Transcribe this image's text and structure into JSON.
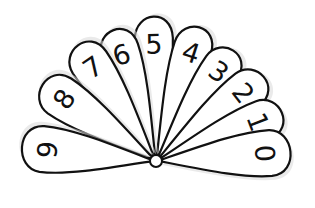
{
  "colors": {
    "outline": "#111111",
    "fill": "#ffffff",
    "background": "#ffffff"
  },
  "pivot": {
    "x": 156,
    "y": 161,
    "r": 6
  },
  "petals": [
    {
      "label": "0",
      "angle": -4,
      "length": 140,
      "width": 46
    },
    {
      "label": "1",
      "angle": -21,
      "length": 140,
      "width": 40
    },
    {
      "label": "2",
      "angle": -38,
      "length": 142,
      "width": 40
    },
    {
      "label": "3",
      "angle": -55,
      "length": 140,
      "width": 38
    },
    {
      "label": "4",
      "angle": -72,
      "length": 146,
      "width": 38
    },
    {
      "label": "5",
      "angle": -91,
      "length": 150,
      "width": 38
    },
    {
      "label": "6",
      "angle": -108,
      "length": 143,
      "width": 38
    },
    {
      "label": "7",
      "angle": -124,
      "length": 145,
      "width": 40
    },
    {
      "label": "8",
      "angle": -146,
      "length": 142,
      "width": 42
    },
    {
      "label": "9",
      "angle": -174,
      "length": 140,
      "width": 46
    }
  ]
}
